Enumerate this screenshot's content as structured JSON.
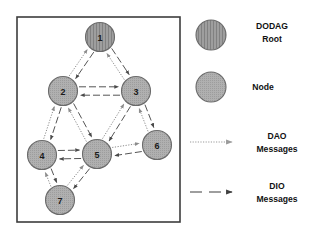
{
  "figure": {
    "kind": "rpl-dodag-diagram",
    "canvas": {
      "width": 324,
      "height": 238,
      "background": "#ffffff"
    },
    "panel": {
      "name": "diagram-panel",
      "x": 17,
      "y": 17,
      "width": 163,
      "height": 205,
      "border_color": "#3d3d3d",
      "border_width": 1.6,
      "fill": "#ffffff"
    },
    "styles": {
      "root_fill": "#9c9c9c",
      "node_fill": "#a8a8a8",
      "node_stroke": "#6a6a6a",
      "dao_color": "#8c8c8c",
      "dio_color": "#555555",
      "label_color": "#1a1a1a"
    },
    "nodes": [
      {
        "id": "1",
        "label": "1",
        "cx": 100,
        "cy": 37,
        "r": 14.5,
        "type": "dodag-root"
      },
      {
        "id": "2",
        "label": "2",
        "cx": 63,
        "cy": 91,
        "r": 14.5,
        "type": "node"
      },
      {
        "id": "3",
        "label": "3",
        "cx": 136,
        "cy": 91,
        "r": 14.5,
        "type": "node"
      },
      {
        "id": "4",
        "label": "4",
        "cx": 42,
        "cy": 155,
        "r": 14.5,
        "type": "node"
      },
      {
        "id": "5",
        "label": "5",
        "cx": 97,
        "cy": 154,
        "r": 14.5,
        "type": "node"
      },
      {
        "id": "6",
        "label": "6",
        "cx": 157,
        "cy": 145,
        "r": 14.5,
        "type": "node"
      },
      {
        "id": "7",
        "label": "7",
        "cx": 60,
        "cy": 200,
        "r": 14.5,
        "type": "node"
      }
    ],
    "edges": [
      {
        "name": "dao-2-to-1",
        "from": "2",
        "to": "1",
        "type": "dao",
        "offset": -3.4
      },
      {
        "name": "dio-1-to-2",
        "from": "1",
        "to": "2",
        "type": "dio",
        "offset": -3.4
      },
      {
        "name": "dao-3-to-1",
        "from": "3",
        "to": "1",
        "type": "dao",
        "offset": -3.4
      },
      {
        "name": "dio-1-to-3",
        "from": "1",
        "to": "3",
        "type": "dio",
        "offset": -3.4
      },
      {
        "name": "dio-2-to-3",
        "from": "2",
        "to": "3",
        "type": "dio",
        "offset": -4.2
      },
      {
        "name": "dio-3-to-2",
        "from": "3",
        "to": "2",
        "type": "dio",
        "offset": -4.2
      },
      {
        "name": "dao-4-to-2",
        "from": "4",
        "to": "2",
        "type": "dao",
        "offset": -3.4
      },
      {
        "name": "dio-2-to-4",
        "from": "2",
        "to": "4",
        "type": "dio",
        "offset": -3.4
      },
      {
        "name": "dao-5-to-2",
        "from": "5",
        "to": "2",
        "type": "dao",
        "offset": -3.4
      },
      {
        "name": "dio-2-to-5",
        "from": "2",
        "to": "5",
        "type": "dio",
        "offset": -3.4
      },
      {
        "name": "dao-5-to-3",
        "from": "5",
        "to": "3",
        "type": "dao",
        "offset": -3.4
      },
      {
        "name": "dio-3-to-5",
        "from": "3",
        "to": "5",
        "type": "dio",
        "offset": -3.4
      },
      {
        "name": "dao-6-to-3",
        "from": "6",
        "to": "3",
        "type": "dao",
        "offset": -3.4
      },
      {
        "name": "dio-3-to-6",
        "from": "3",
        "to": "6",
        "type": "dio",
        "offset": -3.4
      },
      {
        "name": "dio-4-to-5",
        "from": "4",
        "to": "5",
        "type": "dio",
        "offset": -4.2
      },
      {
        "name": "dio-5-to-4",
        "from": "5",
        "to": "4",
        "type": "dio",
        "offset": -4.2
      },
      {
        "name": "dio-6-to-5",
        "from": "6",
        "to": "5",
        "type": "dio",
        "offset": -4.2
      },
      {
        "name": "dao-5-to-6",
        "from": "5",
        "to": "6",
        "type": "dao",
        "offset": -4.2
      },
      {
        "name": "dao-7-to-4",
        "from": "7",
        "to": "4",
        "type": "dao",
        "offset": -3.4
      },
      {
        "name": "dio-4-to-7",
        "from": "4",
        "to": "7",
        "type": "dio",
        "offset": -3.4
      },
      {
        "name": "dao-7-to-5",
        "from": "7",
        "to": "5",
        "type": "dao",
        "offset": -3.4
      },
      {
        "name": "dio-5-to-7",
        "from": "5",
        "to": "7",
        "type": "dio",
        "offset": -3.4
      }
    ]
  },
  "legend": {
    "name": "legend",
    "items": [
      {
        "key": "dodag-root",
        "symbol": "circle-vertical-hatch",
        "cx": 211,
        "cy": 35,
        "r": 15,
        "lines": [
          "DODAG",
          "Root"
        ],
        "text_x": 272,
        "text_y": 29
      },
      {
        "key": "node",
        "symbol": "circle-dotted",
        "cx": 211,
        "cy": 87,
        "r": 15,
        "lines": [
          "Node"
        ],
        "text_x": 263,
        "text_y": 90
      },
      {
        "key": "dao-messages",
        "symbol": "dotted-arrow",
        "x1": 190,
        "x2": 232,
        "y": 142,
        "lines": [
          "DAO",
          "Messages"
        ],
        "text_x": 277,
        "text_y": 139
      },
      {
        "key": "dio-messages",
        "symbol": "dashed-arrow",
        "x1": 190,
        "x2": 232,
        "y": 192,
        "lines": [
          "DIO",
          "Messages"
        ],
        "text_x": 277,
        "text_y": 189
      }
    ]
  }
}
